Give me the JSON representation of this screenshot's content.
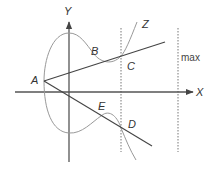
{
  "diagram": {
    "axes": {
      "x_label": "X",
      "y_label": "Y"
    },
    "points": {
      "A": "A",
      "B": "B",
      "C": "C",
      "D": "D",
      "E": "E",
      "Z": "Z"
    },
    "max_label": "max",
    "colors": {
      "axis": "#555555",
      "line": "#444444",
      "curve": "#999999",
      "dotted": "#777777",
      "text": "#333333"
    }
  }
}
